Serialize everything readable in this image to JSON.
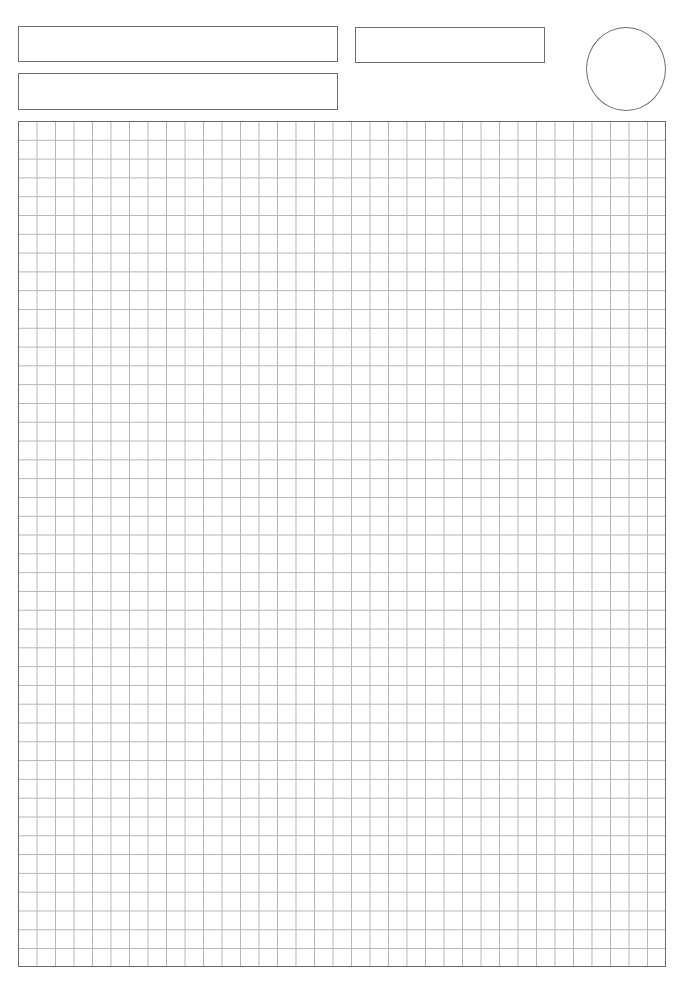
{
  "page": {
    "type": "graph-paper-worksheet",
    "header_fields": [
      {
        "id": "field-1",
        "value": ""
      },
      {
        "id": "field-2",
        "value": ""
      },
      {
        "id": "field-3",
        "value": ""
      }
    ],
    "circle_mark": {
      "value": ""
    },
    "grid": {
      "columns": 35,
      "rows": 45,
      "line_color": "#b5b5b5",
      "border_color": "#6a6a6a"
    },
    "footer": {
      "page_number": ""
    }
  }
}
